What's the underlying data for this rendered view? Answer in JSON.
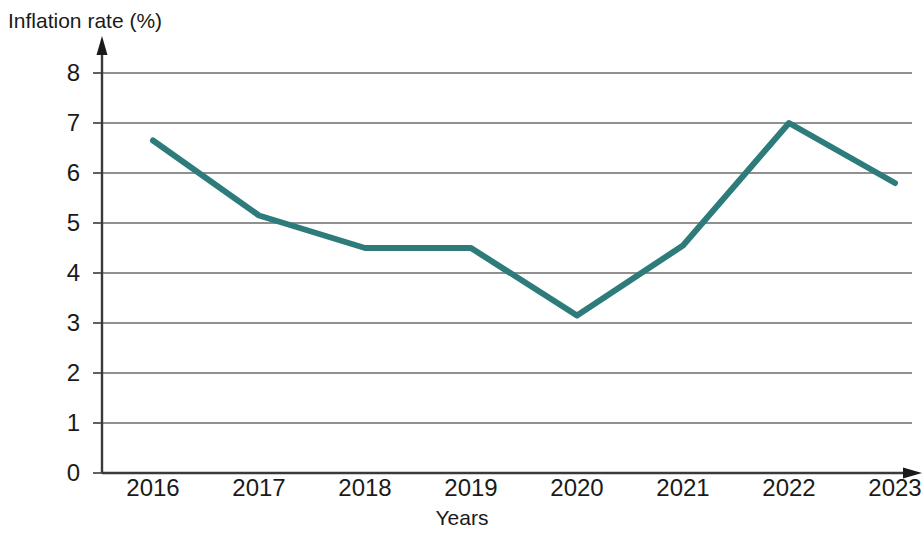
{
  "chart_data": {
    "type": "line",
    "title": "",
    "xlabel": "Years",
    "ylabel": "Inflation rate (%)",
    "categories": [
      "2016",
      "2017",
      "2018",
      "2019",
      "2020",
      "2021",
      "2022",
      "2023"
    ],
    "values": [
      6.65,
      5.15,
      4.5,
      4.5,
      3.15,
      4.55,
      7.0,
      5.8
    ],
    "series": [
      {
        "name": "Inflation rate",
        "values": [
          6.65,
          5.15,
          4.5,
          4.5,
          3.15,
          4.55,
          7.0,
          5.8
        ]
      }
    ],
    "ylim": [
      0,
      8
    ],
    "y_ticks": [
      "0",
      "1",
      "2",
      "3",
      "4",
      "5",
      "6",
      "7",
      "8"
    ],
    "x_ticks": [
      "2016",
      "2017",
      "2018",
      "2019",
      "2020",
      "2021",
      "2022",
      "2023"
    ],
    "grid": "horizontal",
    "legend": "none",
    "line_color": "#2d7b7b",
    "axis_color": "#3a3a3a",
    "grid_color": "#6b6b6b",
    "annotations": []
  },
  "axes": {
    "y_title": "Inflation rate (%)",
    "x_title": "Years"
  }
}
